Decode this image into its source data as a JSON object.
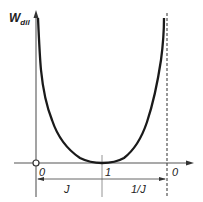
{
  "diagram": {
    "y_axis_label": "W",
    "y_axis_subscript": "dil",
    "x_tick_labels": [
      "0",
      "1",
      "0"
    ],
    "interval_labels": [
      "J",
      "1/J"
    ],
    "curve": {
      "description": "U-shaped curve with minimum at 1 on the horizontal axis, diverging at both ends (at 0 on left and at dashed asymptote on right)",
      "color": "#1a1a1a"
    },
    "colors": {
      "axis": "#555555",
      "curve": "#1a1a1a",
      "background": "#ffffff"
    }
  }
}
